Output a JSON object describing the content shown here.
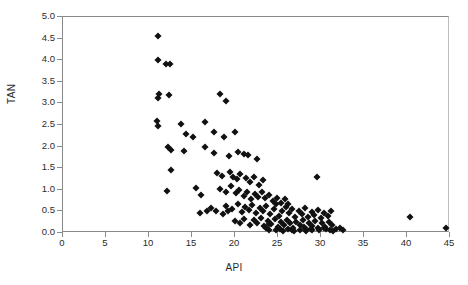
{
  "chart_data": {
    "type": "scatter",
    "title": "",
    "xlabel": "API",
    "ylabel": "TAN",
    "xlim": [
      0,
      45
    ],
    "ylim": [
      0,
      5.0
    ],
    "xticks": [
      0,
      5,
      10,
      15,
      20,
      25,
      30,
      35,
      40,
      45
    ],
    "yticks": [
      0.0,
      0.5,
      1.0,
      1.5,
      2.0,
      2.5,
      3.0,
      3.5,
      4.0,
      4.5,
      5.0
    ],
    "xtick_labels": [
      "0",
      "5",
      "10",
      "15",
      "20",
      "25",
      "30",
      "35",
      "40",
      "45"
    ],
    "ytick_labels": [
      "0.0",
      "0.5",
      "1.0",
      "1.5",
      "2.0",
      "2.5",
      "3.0",
      "3.5",
      "4.0",
      "4.5",
      "5.0"
    ],
    "grid": false,
    "legend": null,
    "marker": "diamond",
    "marker_color": "#111111",
    "marker_size": 5,
    "series": [
      {
        "name": "TAN vs API",
        "points": [
          [
            11.1,
            4.55
          ],
          [
            11.1,
            4.0
          ],
          [
            12.0,
            3.92
          ],
          [
            12.4,
            3.92
          ],
          [
            11.1,
            3.12
          ],
          [
            11.2,
            3.22
          ],
          [
            12.3,
            3.2
          ],
          [
            18.3,
            3.22
          ],
          [
            19.0,
            3.05
          ],
          [
            10.9,
            2.6
          ],
          [
            11.0,
            2.47
          ],
          [
            13.7,
            2.53
          ],
          [
            16.5,
            2.56
          ],
          [
            17.6,
            2.33
          ],
          [
            18.7,
            2.22
          ],
          [
            20.0,
            2.33
          ],
          [
            14.3,
            2.29
          ],
          [
            15.1,
            2.22
          ],
          [
            12.2,
            2.0
          ],
          [
            12.6,
            1.93
          ],
          [
            14.1,
            1.9
          ],
          [
            16.5,
            2.0
          ],
          [
            17.5,
            1.85
          ],
          [
            19.3,
            1.78
          ],
          [
            20.3,
            1.88
          ],
          [
            21.0,
            1.82
          ],
          [
            21.5,
            1.8
          ],
          [
            22.6,
            1.72
          ],
          [
            12.6,
            1.46
          ],
          [
            17.9,
            1.4
          ],
          [
            18.5,
            1.33
          ],
          [
            19.4,
            1.42
          ],
          [
            19.8,
            1.3
          ],
          [
            20.2,
            1.24
          ],
          [
            20.6,
            1.36
          ],
          [
            21.3,
            1.28
          ],
          [
            21.8,
            1.18
          ],
          [
            22.2,
            1.3
          ],
          [
            22.8,
            1.12
          ],
          [
            23.3,
            1.22
          ],
          [
            12.1,
            0.97
          ],
          [
            15.5,
            1.05
          ],
          [
            16.0,
            0.88
          ],
          [
            18.2,
            1.02
          ],
          [
            18.9,
            0.96
          ],
          [
            19.5,
            1.08
          ],
          [
            20.1,
            0.92
          ],
          [
            20.5,
            1.0
          ],
          [
            21.0,
            0.86
          ],
          [
            21.4,
            0.95
          ],
          [
            21.9,
            0.78
          ],
          [
            22.3,
            0.9
          ],
          [
            22.7,
            0.84
          ],
          [
            23.1,
            0.96
          ],
          [
            23.5,
            0.8
          ],
          [
            24.0,
            0.88
          ],
          [
            24.4,
            0.74
          ],
          [
            24.9,
            0.82
          ],
          [
            25.3,
            0.7
          ],
          [
            25.8,
            0.78
          ],
          [
            26.2,
            0.66
          ],
          [
            29.5,
            1.3
          ],
          [
            17.2,
            0.58
          ],
          [
            17.8,
            0.52
          ],
          [
            19.0,
            0.62
          ],
          [
            19.6,
            0.55
          ],
          [
            20.3,
            0.66
          ],
          [
            20.8,
            0.48
          ],
          [
            21.2,
            0.6
          ],
          [
            21.6,
            0.54
          ],
          [
            22.0,
            0.64
          ],
          [
            22.4,
            0.46
          ],
          [
            22.9,
            0.58
          ],
          [
            23.2,
            0.5
          ],
          [
            23.6,
            0.62
          ],
          [
            24.1,
            0.44
          ],
          [
            24.5,
            0.56
          ],
          [
            24.8,
            0.66
          ],
          [
            25.1,
            0.4
          ],
          [
            25.5,
            0.52
          ],
          [
            25.9,
            0.6
          ],
          [
            26.3,
            0.46
          ],
          [
            26.6,
            0.56
          ],
          [
            27.0,
            0.38
          ],
          [
            27.4,
            0.5
          ],
          [
            27.8,
            0.44
          ],
          [
            28.1,
            0.58
          ],
          [
            28.5,
            0.36
          ],
          [
            28.9,
            0.48
          ],
          [
            29.2,
            0.42
          ],
          [
            29.6,
            0.54
          ],
          [
            30.0,
            0.34
          ],
          [
            30.4,
            0.46
          ],
          [
            30.8,
            0.4
          ],
          [
            31.2,
            0.52
          ],
          [
            20.0,
            0.28
          ],
          [
            20.6,
            0.22
          ],
          [
            21.1,
            0.32
          ],
          [
            21.7,
            0.18
          ],
          [
            22.2,
            0.3
          ],
          [
            22.6,
            0.24
          ],
          [
            23.0,
            0.34
          ],
          [
            23.4,
            0.16
          ],
          [
            23.8,
            0.28
          ],
          [
            24.2,
            0.2
          ],
          [
            24.6,
            0.32
          ],
          [
            25.0,
            0.14
          ],
          [
            25.4,
            0.26
          ],
          [
            25.7,
            0.18
          ],
          [
            26.0,
            0.3
          ],
          [
            26.4,
            0.22
          ],
          [
            26.8,
            0.12
          ],
          [
            27.1,
            0.26
          ],
          [
            27.5,
            0.18
          ],
          [
            27.9,
            0.3
          ],
          [
            28.2,
            0.1
          ],
          [
            28.6,
            0.24
          ],
          [
            29.0,
            0.16
          ],
          [
            29.3,
            0.28
          ],
          [
            29.7,
            0.12
          ],
          [
            30.1,
            0.22
          ],
          [
            30.5,
            0.14
          ],
          [
            30.9,
            0.26
          ],
          [
            31.3,
            0.18
          ],
          [
            31.7,
            0.1
          ],
          [
            24.0,
            0.06
          ],
          [
            24.8,
            0.08
          ],
          [
            25.6,
            0.05
          ],
          [
            26.2,
            0.09
          ],
          [
            26.9,
            0.04
          ],
          [
            27.6,
            0.07
          ],
          [
            28.3,
            0.05
          ],
          [
            29.0,
            0.08
          ],
          [
            29.8,
            0.06
          ],
          [
            30.6,
            0.09
          ],
          [
            31.4,
            0.05
          ],
          [
            32.2,
            0.12
          ],
          [
            32.5,
            0.07
          ],
          [
            23.6,
            0.12
          ],
          [
            23.9,
            0.2
          ],
          [
            25.2,
            0.1
          ],
          [
            26.6,
            0.07
          ],
          [
            28.0,
            0.14
          ],
          [
            28.8,
            0.09
          ],
          [
            30.3,
            0.11
          ],
          [
            31.0,
            0.07
          ],
          [
            19.2,
            0.5
          ],
          [
            18.6,
            0.44
          ],
          [
            16.8,
            0.52
          ],
          [
            15.9,
            0.46
          ],
          [
            40.3,
            0.36
          ],
          [
            44.5,
            0.12
          ]
        ]
      }
    ]
  }
}
